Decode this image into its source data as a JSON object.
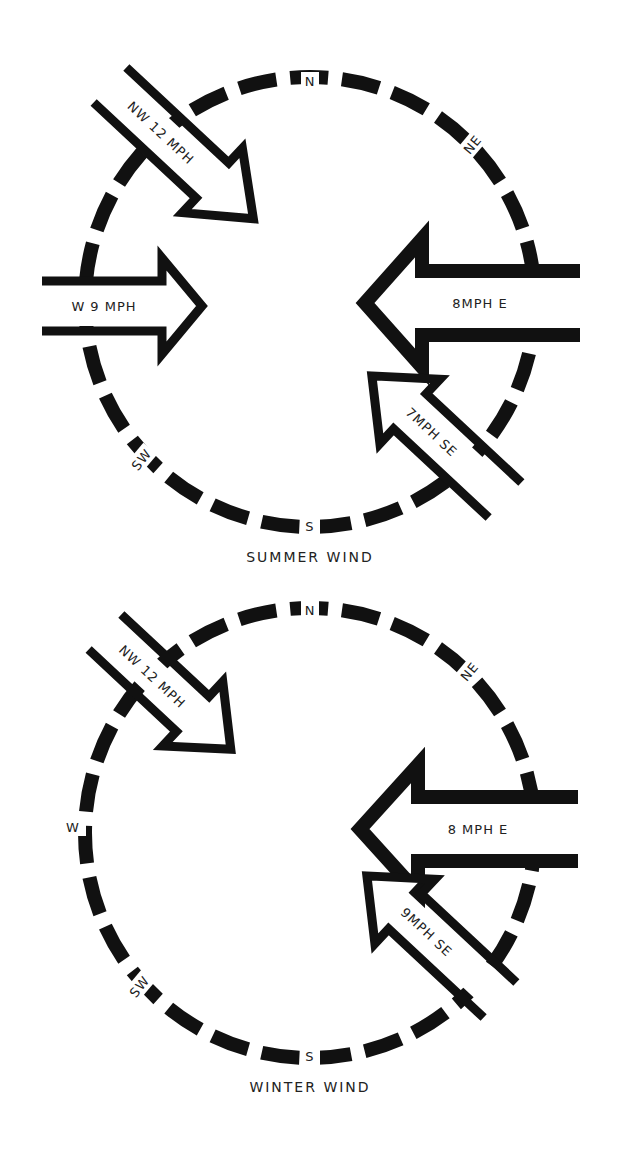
{
  "diagrams": [
    {
      "id": "summer",
      "caption": "SUMMER WIND",
      "compass": {
        "N": "N",
        "NE": "NE",
        "W": "W",
        "SW": "SW",
        "S": "S"
      },
      "arrows": [
        {
          "direction": "NW",
          "label": "NW 12 MPH",
          "speed_mph": 12
        },
        {
          "direction": "W",
          "label": "W 9 MPH",
          "speed_mph": 9
        },
        {
          "direction": "E",
          "label": "8MPH   E",
          "speed_mph": 8
        },
        {
          "direction": "SE",
          "label": "7MPH  SE",
          "speed_mph": 7
        }
      ]
    },
    {
      "id": "winter",
      "caption": "WINTER WIND",
      "compass": {
        "N": "N",
        "NE": "NE",
        "W": "W",
        "SW": "SW",
        "S": "S"
      },
      "arrows": [
        {
          "direction": "NW",
          "label": "NW 12 MPH",
          "speed_mph": 12
        },
        {
          "direction": "E",
          "label": "8 MPH       E",
          "speed_mph": 8
        },
        {
          "direction": "SE",
          "label": "9MPH  SE",
          "speed_mph": 9
        }
      ]
    }
  ],
  "colors": {
    "ink": "#111111",
    "background": "#ffffff"
  }
}
